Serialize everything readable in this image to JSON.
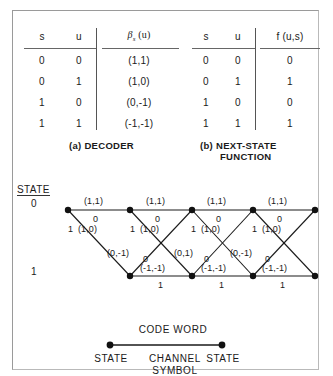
{
  "figure": {
    "tables": [
      {
        "id": "decoder",
        "headers": [
          "s",
          "u",
          "βs (u)"
        ],
        "header_math": {
          "symbol": "β",
          "subscript": "s",
          "arg": "(u)"
        },
        "rows": [
          [
            "0",
            "0",
            "(1,1)"
          ],
          [
            "0",
            "1",
            "(1,0)"
          ],
          [
            "1",
            "0",
            "(0,-1)"
          ],
          [
            "1",
            "1",
            "(-1,-1)"
          ]
        ],
        "caption": "(a) DECODER"
      },
      {
        "id": "next-state-function",
        "headers": [
          "s",
          "u",
          "f (u,s)"
        ],
        "rows": [
          [
            "0",
            "0",
            "0"
          ],
          [
            "0",
            "1",
            "1"
          ],
          [
            "1",
            "0",
            "0"
          ],
          [
            "1",
            "1",
            "1"
          ]
        ],
        "caption_line1": "(b) NEXT-STATE",
        "caption_line2": "FUNCTION"
      }
    ],
    "trellis": {
      "axis_label": "STATE",
      "state_top": "0",
      "state_bottom": "1",
      "top_edge_codeword": "(1,1)",
      "top_edge_bit": "0",
      "down_edge_codeword": "(1,0)",
      "down_edge_bit": "1",
      "bottom_edge_codeword": "(-1,-1)",
      "bottom_edge_bit": "1",
      "up_edge_bit": "0",
      "up_edge_codewords": [
        "(0,-1)",
        "(0,1)",
        "(0,-1)"
      ],
      "columns": 5
    },
    "legend": {
      "codeword": "CODE WORD",
      "left_state": "STATE",
      "right_state": "STATE",
      "channel_line1": "CHANNEL",
      "channel_line2": "SYMBOL"
    }
  }
}
